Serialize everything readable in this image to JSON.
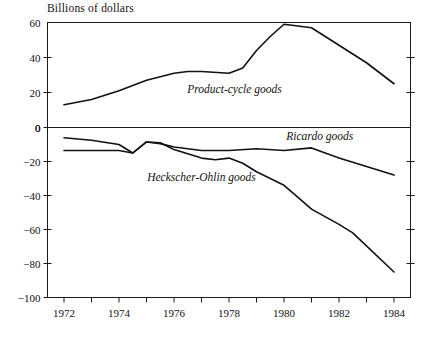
{
  "chart_data": {
    "type": "line",
    "title": "",
    "ylabel": "Billions of dollars",
    "xlabel": "",
    "grid": false,
    "legend": "inline-annotations",
    "x": [
      1972,
      1973,
      1974,
      1975,
      1976,
      1977,
      1978,
      1979,
      1980,
      1981,
      1982,
      1983,
      1984
    ],
    "panels": [
      {
        "name": "upper-panel",
        "ylim": [
          0,
          60
        ],
        "yticks": [
          0,
          20,
          40,
          60
        ],
        "ytick_labels": [
          "0",
          "20",
          "40",
          "60"
        ],
        "series": [
          {
            "name": "Product-cycle goods",
            "label": "Product-cycle goods",
            "values": [
              13,
              16,
              21,
              27,
              31,
              32,
              32,
              31,
              34,
              44,
              52,
              59,
              57,
              47,
              37,
              25
            ],
            "x_dense": [
              1972,
              1973,
              1974,
              1975,
              1976,
              1976.5,
              1977,
              1978,
              1978.5,
              1979,
              1979.5,
              1980,
              1981,
              1982,
              1983,
              1984
            ]
          }
        ]
      },
      {
        "name": "lower-panel",
        "ylim": [
          -100,
          0
        ],
        "yticks": [
          0,
          -20,
          -40,
          -60,
          -80,
          -100
        ],
        "ytick_labels": [
          "0",
          "−20",
          "−40",
          "−60",
          "−80",
          "−100"
        ],
        "series": [
          {
            "name": "Ricardo goods",
            "label": "Ricardo goods",
            "values": [
              -6,
              -7.5,
              -10,
              -15,
              -8.5,
              -9.5,
              -11.5,
              -13.5,
              -13.5,
              -12.5,
              -13.5,
              -12,
              -18,
              -23,
              -28
            ],
            "x_dense": [
              1972,
              1973,
              1974,
              1974.5,
              1975,
              1975.5,
              1976,
              1977,
              1978,
              1979,
              1980,
              1981,
              1982,
              1983,
              1984
            ]
          },
          {
            "name": "Heckscher-Ohlin goods",
            "label": "Heckscher-Ohlin goods",
            "values": [
              -13.5,
              -13.5,
              -13.5,
              -15,
              -8.5,
              -9,
              -13,
              -18,
              -19,
              -18,
              -21,
              -26,
              -34,
              -41,
              -48,
              -57,
              -62,
              -85
            ],
            "x_dense": [
              1972,
              1973,
              1974,
              1974.5,
              1975,
              1975.5,
              1976,
              1977,
              1977.5,
              1978,
              1978.5,
              1979,
              1980,
              1980.5,
              1981,
              1982,
              1982.5,
              1984
            ]
          }
        ]
      }
    ],
    "xticks": [
      1972,
      1973,
      1974,
      1975,
      1976,
      1977,
      1978,
      1979,
      1980,
      1981,
      1982,
      1983,
      1984
    ],
    "xtick_labels_shown": [
      "1972",
      "1974",
      "1976",
      "1978",
      "1980",
      "1982",
      "1984"
    ],
    "xtick_labeled_values": [
      1972,
      1974,
      1976,
      1978,
      1980,
      1982,
      1984
    ],
    "xlim": [
      1971.4,
      1984.6
    ],
    "annotations": [
      {
        "text": "Product-cycle goods",
        "x": 1978.2,
        "panel": "upper",
        "y": 22
      },
      {
        "text": "Ricardo goods",
        "x": 1981.3,
        "panel": "lower",
        "y": -5
      },
      {
        "text": "Heckscher-Ohlin goods",
        "x": 1977.0,
        "panel": "lower",
        "y": -29
      }
    ],
    "colors": {
      "line": "#111111",
      "frame": "#1a1a1a",
      "background": "#ffffff"
    }
  }
}
